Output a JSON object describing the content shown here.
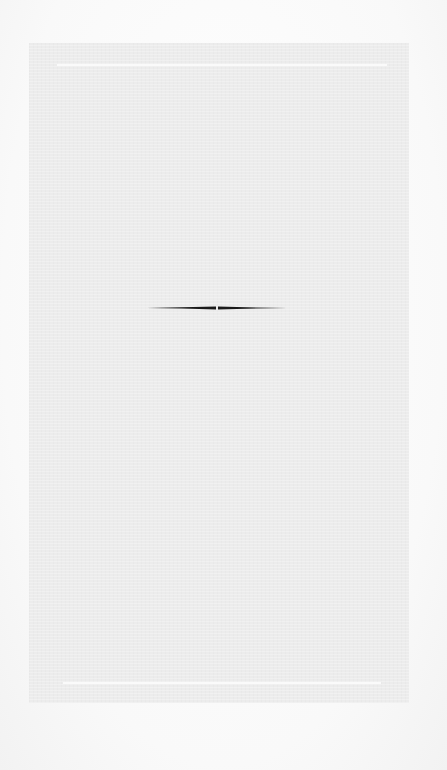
{
  "document": {
    "type": "blank scanned page",
    "text": "",
    "ornament": {
      "kind": "horizontal tapered divider",
      "color": "#1a1a1a"
    },
    "page_color": "#ececec",
    "rule_color": "#fafafa"
  }
}
